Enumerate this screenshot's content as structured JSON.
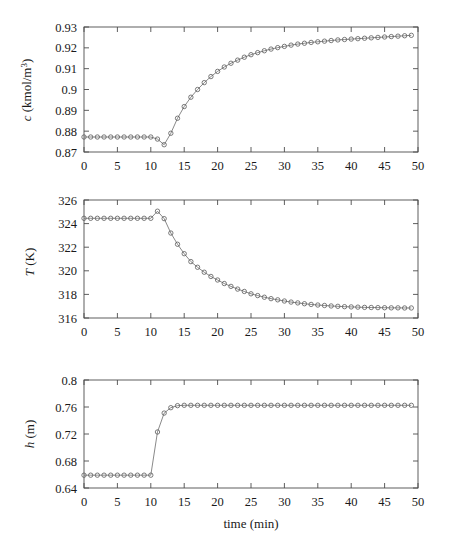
{
  "figure": {
    "name": "three-panel-process-response-figure",
    "xlabel": "time (min)",
    "background_color": "#ffffff",
    "axis_color": "#4d4d4d",
    "line_color": "#6b6b6b",
    "marker_color": "#5a5a5a"
  },
  "axis": {
    "x_ticklabels": [
      "0",
      "5",
      "10",
      "15",
      "20",
      "25",
      "30",
      "35",
      "40",
      "45",
      "50"
    ],
    "c_ticklabels": [
      "0.87",
      "0.88",
      "0.89",
      "0.9",
      "0.91",
      "0.92",
      "0.93"
    ],
    "T_ticklabels": [
      "316",
      "318",
      "320",
      "322",
      "324",
      "326"
    ],
    "h_ticklabels": [
      "0.64",
      "0.68",
      "0.72",
      "0.76",
      "0.8"
    ],
    "c_label_main": "c",
    "c_label_units": " (kmol/m",
    "c_label_exp": "3",
    "c_label_close": ")",
    "T_label_main": "T",
    "T_label_units": " (K)",
    "h_label_main": "h",
    "h_label_units": " (m)"
  },
  "chart_data": [
    {
      "type": "line",
      "title": "",
      "panel": "top",
      "xlabel": "time (min)",
      "ylabel": "c (kmol/m^3)",
      "xlim": [
        0,
        50
      ],
      "ylim": [
        0.87,
        0.93
      ],
      "xticks": [
        0,
        5,
        10,
        15,
        20,
        25,
        30,
        35,
        40,
        45,
        50
      ],
      "yticks": [
        0.87,
        0.88,
        0.89,
        0.9,
        0.91,
        0.92,
        0.93
      ],
      "grid": false,
      "legend": "none",
      "marker": "open-circle",
      "x": [
        0,
        1,
        2,
        3,
        4,
        5,
        6,
        7,
        8,
        9,
        10,
        11,
        12,
        13,
        14,
        15,
        16,
        17,
        18,
        19,
        20,
        21,
        22,
        23,
        24,
        25,
        26,
        27,
        28,
        29,
        30,
        31,
        32,
        33,
        34,
        35,
        36,
        37,
        38,
        39,
        40,
        41,
        42,
        43,
        44,
        45,
        46,
        47,
        48,
        49
      ],
      "values": [
        0.8772,
        0.8772,
        0.8772,
        0.8772,
        0.8772,
        0.8772,
        0.8772,
        0.8772,
        0.8772,
        0.8772,
        0.8772,
        0.8762,
        0.8735,
        0.879,
        0.8862,
        0.8918,
        0.8963,
        0.9,
        0.9033,
        0.9062,
        0.9087,
        0.9108,
        0.9126,
        0.9141,
        0.9155,
        0.9167,
        0.9177,
        0.9186,
        0.9194,
        0.9201,
        0.9207,
        0.9213,
        0.9218,
        0.9222,
        0.9226,
        0.9229,
        0.9232,
        0.9235,
        0.9238,
        0.924,
        0.9242,
        0.9244,
        0.9246,
        0.9248,
        0.925,
        0.9252,
        0.9254,
        0.9256,
        0.9258,
        0.926
      ]
    },
    {
      "type": "line",
      "title": "",
      "panel": "middle",
      "xlabel": "time (min)",
      "ylabel": "T (K)",
      "xlim": [
        0,
        50
      ],
      "ylim": [
        316,
        326
      ],
      "xticks": [
        0,
        5,
        10,
        15,
        20,
        25,
        30,
        35,
        40,
        45,
        50
      ],
      "yticks": [
        316,
        318,
        320,
        322,
        324,
        326
      ],
      "grid": false,
      "legend": "none",
      "marker": "open-circle",
      "x": [
        0,
        1,
        2,
        3,
        4,
        5,
        6,
        7,
        8,
        9,
        10,
        11,
        12,
        13,
        14,
        15,
        16,
        17,
        18,
        19,
        20,
        21,
        22,
        23,
        24,
        25,
        26,
        27,
        28,
        29,
        30,
        31,
        32,
        33,
        34,
        35,
        36,
        37,
        38,
        39,
        40,
        41,
        42,
        43,
        44,
        45,
        46,
        47,
        48,
        49
      ],
      "values": [
        324.45,
        324.45,
        324.45,
        324.45,
        324.45,
        324.45,
        324.45,
        324.45,
        324.45,
        324.45,
        324.45,
        325.05,
        324.42,
        323.2,
        322.25,
        321.45,
        320.78,
        320.3,
        319.88,
        319.52,
        319.22,
        318.92,
        318.68,
        318.45,
        318.25,
        318.05,
        317.9,
        317.76,
        317.64,
        317.54,
        317.44,
        317.35,
        317.28,
        317.21,
        317.15,
        317.1,
        317.06,
        317.02,
        316.99,
        316.96,
        316.94,
        316.92,
        316.9,
        316.89,
        316.88,
        316.87,
        316.86,
        316.86,
        316.85,
        316.85
      ]
    },
    {
      "type": "line",
      "title": "",
      "panel": "bottom",
      "xlabel": "time (min)",
      "ylabel": "h (m)",
      "xlim": [
        0,
        50
      ],
      "ylim": [
        0.64,
        0.8
      ],
      "xticks": [
        0,
        5,
        10,
        15,
        20,
        25,
        30,
        35,
        40,
        45,
        50
      ],
      "yticks": [
        0.64,
        0.68,
        0.72,
        0.76,
        0.8
      ],
      "grid": false,
      "legend": "none",
      "marker": "open-circle",
      "x": [
        0,
        1,
        2,
        3,
        4,
        5,
        6,
        7,
        8,
        9,
        10,
        11,
        12,
        13,
        14,
        15,
        16,
        17,
        18,
        19,
        20,
        21,
        22,
        23,
        24,
        25,
        26,
        27,
        28,
        29,
        30,
        31,
        32,
        33,
        34,
        35,
        36,
        37,
        38,
        39,
        40,
        41,
        42,
        43,
        44,
        45,
        46,
        47,
        48,
        49
      ],
      "values": [
        0.659,
        0.659,
        0.659,
        0.659,
        0.659,
        0.659,
        0.659,
        0.659,
        0.659,
        0.659,
        0.659,
        0.723,
        0.751,
        0.759,
        0.762,
        0.7625,
        0.7625,
        0.7625,
        0.7625,
        0.7625,
        0.7625,
        0.7625,
        0.7625,
        0.7625,
        0.7625,
        0.7625,
        0.7625,
        0.7625,
        0.7625,
        0.7625,
        0.7625,
        0.7625,
        0.7625,
        0.7625,
        0.7625,
        0.7625,
        0.7625,
        0.7625,
        0.7625,
        0.7625,
        0.7625,
        0.7625,
        0.7625,
        0.7625,
        0.7625,
        0.7625,
        0.7625,
        0.7625,
        0.7625,
        0.7625
      ]
    }
  ]
}
